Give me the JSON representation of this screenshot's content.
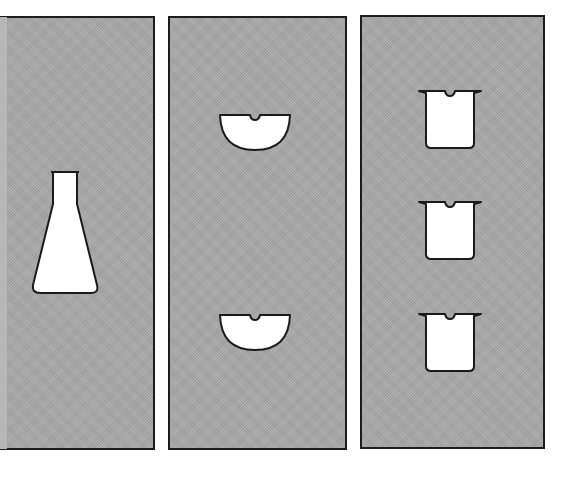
{
  "figure": {
    "colors": {
      "background": "#ffffff",
      "panel_fill": "#a9a9a9",
      "panel_border": "#1c1c1c",
      "shape_fill": "#ffffff",
      "shape_stroke": "#1a1a1a"
    },
    "panels": [
      {
        "name": "left-panel",
        "contents": [
          "erlenmeyer-flask"
        ],
        "count": 1
      },
      {
        "name": "middle-panel",
        "contents": [
          "evaporating-dish",
          "evaporating-dish"
        ],
        "count": 2
      },
      {
        "name": "right-panel",
        "contents": [
          "beaker",
          "beaker",
          "beaker"
        ],
        "count": 3
      }
    ]
  }
}
